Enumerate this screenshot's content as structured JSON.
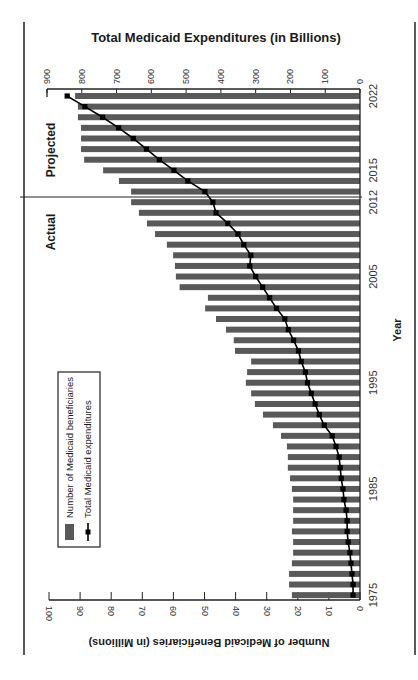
{
  "chart_data": {
    "type": "bar",
    "orientation": "rotated-90",
    "title": "Total Medicaid Expenditures (in Billions)",
    "xlabel": "Year",
    "ylabel": "Number of Medicaid Beneficiaries (in Millions)",
    "y2label": "Total Medicaid Expenditures (in Billions)",
    "ylim": [
      0,
      100
    ],
    "y2lim": [
      0,
      900
    ],
    "y_ticks": [
      0,
      10,
      20,
      30,
      40,
      50,
      60,
      70,
      80,
      90,
      100
    ],
    "y2_ticks": [
      0,
      100,
      200,
      300,
      400,
      500,
      600,
      700,
      800,
      900
    ],
    "x_tick_labels": [
      "1975",
      "1985",
      "1995",
      "2005",
      "2012",
      "2015",
      "2022"
    ],
    "grid": false,
    "legend_position": "lower-left (rotated)",
    "categories": [
      "1975",
      "1976",
      "1977",
      "1978",
      "1979",
      "1980",
      "1981",
      "1982",
      "1983",
      "1984",
      "1985",
      "1986",
      "1987",
      "1988",
      "1989",
      "1990",
      "1991",
      "1992",
      "1993",
      "1994",
      "1995",
      "1996",
      "1997",
      "1998",
      "1999",
      "2000",
      "2001",
      "2002",
      "2003",
      "2004",
      "2005",
      "2006",
      "2007",
      "2008",
      "2009",
      "2010",
      "2011",
      "2012",
      "2013",
      "2014",
      "2015",
      "2016",
      "2017",
      "2018",
      "2019",
      "2020",
      "2021",
      "2022"
    ],
    "series": [
      {
        "name": "Number of Medicaid beneficiaries",
        "type": "bar",
        "axis": "left (millions)",
        "color": "#595959",
        "values": [
          21.9,
          22.8,
          22.8,
          21.9,
          21.5,
          21.5,
          21.9,
          21.5,
          21.5,
          21.5,
          21.9,
          22.5,
          23.2,
          23.2,
          23.5,
          25.4,
          28.0,
          31.2,
          33.8,
          35.0,
          36.7,
          36.3,
          35.0,
          40.2,
          40.6,
          43.1,
          46.3,
          49.8,
          48.9,
          58.0,
          59.2,
          59.5,
          60.1,
          62.1,
          65.9,
          68.5,
          71.1,
          73.6,
          73.6,
          77.5,
          82.6,
          88.7,
          89.7,
          89.7,
          89.7,
          90.7,
          90.7,
          91.6
        ]
      },
      {
        "name": "Total Medicaid expenditures",
        "type": "line",
        "axis": "right (billions)",
        "color": "#000000",
        "values": [
          20,
          20,
          23,
          26,
          29,
          34,
          37,
          37,
          40,
          46,
          49,
          54,
          57,
          60,
          69,
          80,
          103,
          117,
          129,
          140,
          151,
          157,
          169,
          177,
          191,
          206,
          216,
          240,
          260,
          280,
          300,
          317,
          314,
          334,
          351,
          380,
          414,
          423,
          446,
          495,
          535,
          577,
          614,
          652,
          694,
          740,
          791,
          842
        ]
      }
    ],
    "annotations": [
      {
        "text": "Actual",
        "range": [
          "1975",
          "2012"
        ]
      },
      {
        "text": "Projected",
        "range": [
          "2013",
          "2022"
        ]
      }
    ]
  },
  "labels": {
    "title": "Total Medicaid Expenditures (in Billions)",
    "left_axis_title": "Number of Medicaid Beneficiaries (in Millions)",
    "x_axis_title": "Year",
    "actual": "Actual",
    "projected": "Projected",
    "legend_bars": "Number of Medicaid beneficiaries",
    "legend_line": "Total Medicaid expenditures"
  },
  "colors": {
    "bar": "#595959",
    "line": "#000000",
    "axis": "#222222"
  }
}
